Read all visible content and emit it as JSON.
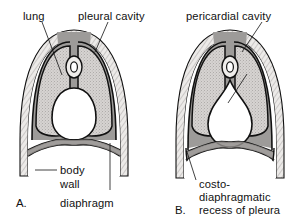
{
  "figure": {
    "colors": {
      "ink": "#111111",
      "lung_fill": "#cfcccb",
      "mediastinum_fill": "#9d9b99",
      "body_wall_fill": "#e9e7e5",
      "cavity_fill": "#ffffff",
      "page_background": "#ffffff"
    }
  },
  "panels": [
    {
      "id": "A",
      "letter": "A.",
      "labels": [
        {
          "id": "lung",
          "text": "lung"
        },
        {
          "id": "pleural-cavity",
          "text": "pleural cavity"
        },
        {
          "id": "body-wall",
          "text_line_1": "body",
          "text_line_2": "wall"
        },
        {
          "id": "diaphragm",
          "text": "diaphragm"
        }
      ]
    },
    {
      "id": "B",
      "letter": "B.",
      "labels": [
        {
          "id": "pericardial-cavity",
          "text": "pericardial cavity"
        },
        {
          "id": "costodiaphragmatic-recess",
          "text_line_1": "costo-",
          "text_line_2": "diaphragmatic",
          "text_line_3": "recess of pleura"
        }
      ]
    }
  ],
  "labels_flat": {
    "lung": "lung",
    "pleural_cavity": "pleural cavity",
    "body_wall_1": "body",
    "body_wall_2": "wall",
    "diaphragm": "diaphragm",
    "panel_a_letter": "A.",
    "pericardial_cavity": "pericardial cavity",
    "costo_1": "costo-",
    "costo_2": "diaphragmatic",
    "costo_3": "recess of pleura",
    "panel_b_letter": "B."
  }
}
